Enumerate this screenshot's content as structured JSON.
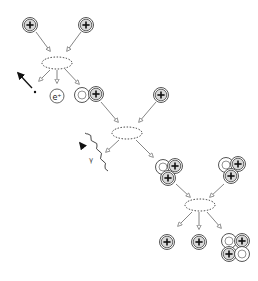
{
  "diagram": {
    "colors": {
      "proton_fill": "#d9d9d9",
      "neutron_fill": "#ffffff",
      "stroke": "#444444",
      "arrow": "#777777",
      "ellipse": "#333333",
      "dark": "#111111"
    },
    "labels": {
      "positron": "e⁺",
      "gamma": "γ",
      "proton_sign": "+"
    },
    "particles": [
      {
        "id": "proton-1",
        "type": "proton",
        "x": 30,
        "y": 25
      },
      {
        "id": "proton-2",
        "type": "proton",
        "x": 86,
        "y": 25
      },
      {
        "id": "deuterium-1",
        "type": "deuterium",
        "x": 89,
        "y": 94
      },
      {
        "id": "proton-3",
        "type": "proton",
        "x": 161,
        "y": 95
      },
      {
        "id": "helium3-1",
        "type": "helium3",
        "x": 170,
        "y": 170
      },
      {
        "id": "helium3-2",
        "type": "helium3",
        "x": 233,
        "y": 168
      },
      {
        "id": "proton-4",
        "type": "proton",
        "x": 167,
        "y": 242
      },
      {
        "id": "proton-5",
        "type": "proton",
        "x": 199,
        "y": 242
      },
      {
        "id": "helium4-1",
        "type": "helium4",
        "x": 237,
        "y": 247
      }
    ],
    "reactions": [
      {
        "id": "reaction-1",
        "x": 57,
        "y": 63
      },
      {
        "id": "reaction-2",
        "x": 127,
        "y": 133
      },
      {
        "id": "reaction-3",
        "x": 200,
        "y": 205
      }
    ]
  }
}
